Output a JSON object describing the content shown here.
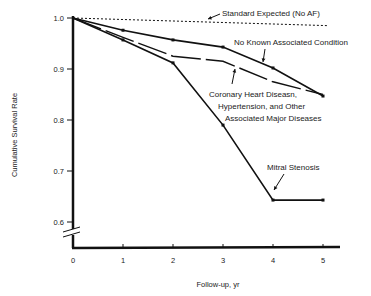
{
  "chart_data": {
    "type": "line",
    "title": "",
    "xlabel": "Follow-up, yr",
    "ylabel": "Cumulative Survival Rate",
    "x": [
      0,
      1,
      2,
      3,
      4,
      5
    ],
    "x_ticks": [
      "0",
      "1",
      "2",
      "3",
      "4",
      "5"
    ],
    "y_ticks": [
      "1.0",
      "0.9",
      "0.8",
      "0.7",
      "0.6"
    ],
    "ylim": [
      0.55,
      1.0
    ],
    "xlim": [
      0,
      5.3
    ],
    "y_axis_break": true,
    "grid": false,
    "legend": "inline annotations",
    "series": [
      {
        "name": "Standard Expected (No AF)",
        "style": "dotted",
        "values": [
          1.0,
          0.997,
          0.994,
          0.991,
          0.988,
          0.985
        ]
      },
      {
        "name": "No Known Associated Condition",
        "style": "solid",
        "values": [
          1.0,
          0.976,
          0.957,
          0.943,
          0.902,
          0.847
        ]
      },
      {
        "name": "Coronary Heart Diseasn, Hypertension, and Other Associated Major Diseases",
        "style": "dashed",
        "values": [
          1.0,
          0.962,
          0.925,
          0.915,
          0.875,
          0.85
        ]
      },
      {
        "name": "Mitral Stenosis",
        "style": "solid",
        "values": [
          1.0,
          0.957,
          0.912,
          0.79,
          0.643,
          0.643
        ]
      }
    ],
    "annotations": [
      "Standard Expected (No AF)",
      "No Known Associated Condition",
      "Coronary Heart Diseasn,",
      "Hypertension, and Other",
      "Associated Major Diseases",
      "Mitral Stenosis"
    ]
  }
}
